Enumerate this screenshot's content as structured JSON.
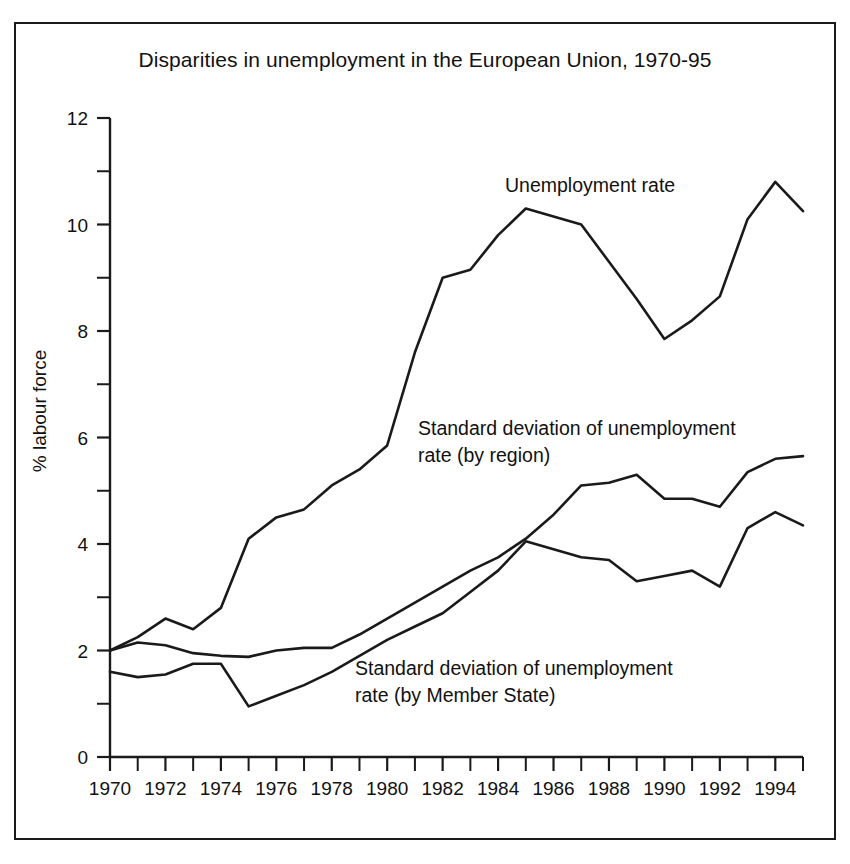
{
  "figure": {
    "title": "Disparities in unemployment in the European Union, 1970-95",
    "ylabel": "% labour force",
    "xlabel": "",
    "border_color": "#1a1a1a",
    "line_color": "#1a1a1a",
    "background": "#ffffff"
  },
  "annotations": {
    "unemployment": "Unemployment rate",
    "region": "Standard deviation of unemployment\nrate (by region)",
    "member_state": "Standard deviation of unemployment\nrate (by Member State)"
  },
  "axes": {
    "y_ticks_major": [
      0,
      2,
      4,
      6,
      8,
      10,
      12
    ],
    "y_ticks_minor": [
      1,
      3,
      5,
      7,
      9,
      11
    ],
    "y_tick_labels": [
      "0",
      "2",
      "4",
      "6",
      "8",
      "10",
      "12"
    ],
    "ylim": [
      0,
      12
    ],
    "xlim": [
      1970,
      1995
    ],
    "x_ticks_all": [
      1970,
      1971,
      1972,
      1973,
      1974,
      1975,
      1976,
      1977,
      1978,
      1979,
      1980,
      1981,
      1982,
      1983,
      1984,
      1985,
      1986,
      1987,
      1988,
      1989,
      1990,
      1991,
      1992,
      1993,
      1994,
      1995
    ],
    "x_tick_labels": [
      "1970",
      "1972",
      "1974",
      "1976",
      "1978",
      "1980",
      "1982",
      "1984",
      "1986",
      "1988",
      "1990",
      "1992",
      "1994"
    ],
    "x_labelled_years": [
      1970,
      1972,
      1974,
      1976,
      1978,
      1980,
      1982,
      1984,
      1986,
      1988,
      1990,
      1992,
      1994
    ],
    "grid": false,
    "legend_position": "inline-annotations"
  },
  "chart_data": {
    "type": "line",
    "title": "Disparities in unemployment in the European Union, 1970-95",
    "xlabel": "",
    "ylabel": "% labour force",
    "xlim": [
      1970,
      1995
    ],
    "ylim": [
      0,
      12
    ],
    "grid": false,
    "legend_position": "inline-annotations",
    "x": [
      1970,
      1971,
      1972,
      1973,
      1974,
      1975,
      1976,
      1977,
      1978,
      1979,
      1980,
      1981,
      1982,
      1983,
      1984,
      1985,
      1986,
      1987,
      1988,
      1989,
      1990,
      1991,
      1992,
      1993,
      1994,
      1995
    ],
    "series": [
      {
        "name": "Unemployment rate",
        "values": [
          2.0,
          2.25,
          2.6,
          2.4,
          2.8,
          4.1,
          4.5,
          4.65,
          5.1,
          5.4,
          5.85,
          7.6,
          9.0,
          9.15,
          9.8,
          10.3,
          10.15,
          10.0,
          9.3,
          8.6,
          7.85,
          8.2,
          8.65,
          10.1,
          10.8,
          10.25
        ]
      },
      {
        "name": "Standard deviation of unemployment rate (by region)",
        "values": [
          2.0,
          2.15,
          2.1,
          1.95,
          1.9,
          1.88,
          2.0,
          2.05,
          2.05,
          2.3,
          2.6,
          2.9,
          3.2,
          3.5,
          3.75,
          4.1,
          4.55,
          5.1,
          5.15,
          5.3,
          4.85,
          4.85,
          4.7,
          5.35,
          5.6,
          5.65
        ]
      },
      {
        "name": "Standard deviation of unemployment rate (by Member State)",
        "values": [
          1.6,
          1.5,
          1.55,
          1.75,
          1.75,
          0.95,
          1.15,
          1.35,
          1.6,
          1.9,
          2.2,
          2.45,
          2.7,
          3.1,
          3.5,
          4.05,
          3.9,
          3.75,
          3.7,
          3.3,
          3.4,
          3.5,
          3.2,
          4.3,
          4.6,
          4.35
        ]
      }
    ]
  }
}
